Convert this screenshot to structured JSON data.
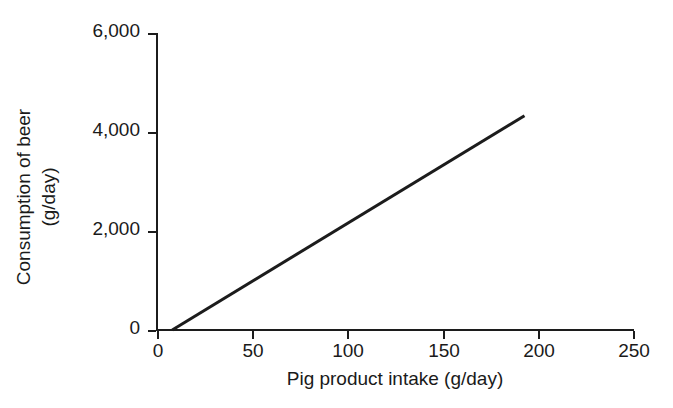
{
  "chart_data": {
    "type": "line",
    "title": "",
    "subtitle": "",
    "xlabel": "Pig product intake (g/day)",
    "ylabel_line1": "Consumption of beer",
    "ylabel_line2": "(g/day)",
    "ylabel": "Consumption of beer (g/day)",
    "xlim": [
      0,
      250
    ],
    "ylim": [
      0,
      6000
    ],
    "xticks": [
      0,
      50,
      100,
      150,
      200,
      250
    ],
    "yticks": [
      0,
      2000,
      4000,
      6000
    ],
    "xtick_labels": [
      "0",
      "50",
      "100",
      "150",
      "200",
      "250"
    ],
    "ytick_labels": [
      "0",
      "2,000",
      "4,000",
      "6,000"
    ],
    "grid": false,
    "legend": false,
    "legend_position": "none",
    "series": [
      {
        "name": "Fitted line",
        "color": "#1c1c1c",
        "line_width": 3,
        "x": [
          8,
          193
        ],
        "values": [
          0,
          4330
        ]
      }
    ],
    "annotations": []
  },
  "axes": {
    "tick_direction": "outward",
    "spines": [
      "left",
      "bottom"
    ],
    "background": "#ffffff",
    "ink_color": "#1c1c1c"
  }
}
